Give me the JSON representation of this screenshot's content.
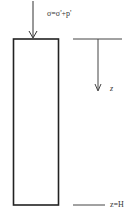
{
  "diagram": {
    "stress_label": "σ=σ'+p'",
    "depth_axis_label": "z",
    "bottom_label": "z=H",
    "colors": {
      "stroke": "#222222",
      "axis_stroke": "#444444",
      "background": "#ffffff"
    }
  }
}
